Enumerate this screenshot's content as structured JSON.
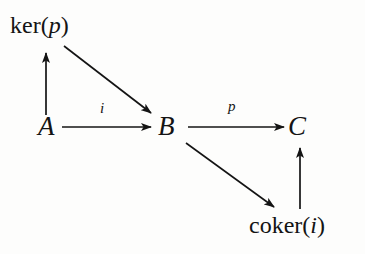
{
  "diagram": {
    "kind": "commutative-diagram",
    "background_color": "#fdfdfc",
    "ink_color": "#141414",
    "objects": [
      {
        "id": "ker",
        "label": "ker(p)",
        "name": "ker",
        "arg": "p",
        "x": 44,
        "y": 28
      },
      {
        "id": "a",
        "label": "A",
        "x": 48,
        "y": 127
      },
      {
        "id": "b",
        "label": "B",
        "x": 169,
        "y": 127
      },
      {
        "id": "c",
        "label": "C",
        "x": 299,
        "y": 127
      },
      {
        "id": "coker",
        "label": "coker(i)",
        "name": "coker",
        "arg": "i",
        "x": 295,
        "y": 228
      }
    ],
    "morphisms": [
      {
        "id": "a-to-ker",
        "from": "A",
        "to": "ker(p)",
        "label": "",
        "style": "vertical-up"
      },
      {
        "id": "ker-to-b",
        "from": "ker(p)",
        "to": "B",
        "label": "",
        "style": "diagonal-down-right"
      },
      {
        "id": "a-to-b",
        "from": "A",
        "to": "B",
        "label": "i",
        "style": "horizontal-right"
      },
      {
        "id": "b-to-c",
        "from": "B",
        "to": "C",
        "label": "p",
        "style": "horizontal-right"
      },
      {
        "id": "b-to-coker",
        "from": "B",
        "to": "coker(i)",
        "label": "",
        "style": "diagonal-down-right"
      },
      {
        "id": "coker-to-c",
        "from": "coker(i)",
        "to": "C",
        "label": "",
        "style": "vertical-up"
      }
    ]
  }
}
